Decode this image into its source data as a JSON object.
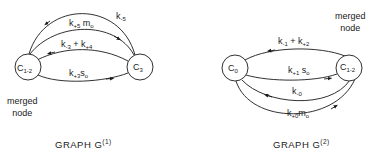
{
  "graphs": [
    {
      "id": "G1",
      "caption": {
        "prefix": "GRAPH G",
        "superscript": "(1)"
      },
      "merged_note": [
        "merged",
        "node"
      ],
      "nodes": [
        {
          "id": "C1-2",
          "base": "C",
          "sub": "1-2",
          "merged": true
        },
        {
          "id": "C3",
          "base": "C",
          "sub": "3"
        }
      ],
      "edges": [
        {
          "from": "C3",
          "to": "C1-2",
          "label": [
            {
              "t": "k"
            },
            {
              "s": "-5"
            }
          ]
        },
        {
          "from": "C1-2",
          "to": "C3",
          "label": [
            {
              "t": "k"
            },
            {
              "s": "+5"
            },
            {
              "t": " m"
            },
            {
              "s": "o"
            }
          ]
        },
        {
          "from": "C3",
          "to": "C1-2",
          "label": [
            {
              "t": "k"
            },
            {
              "s": "-3"
            },
            {
              "t": " + k"
            },
            {
              "s": "+4"
            }
          ]
        },
        {
          "from": "C1-2",
          "to": "C3",
          "label": [
            {
              "t": "k"
            },
            {
              "s": "+3"
            },
            {
              "t": "s"
            },
            {
              "s": "o"
            }
          ]
        }
      ]
    },
    {
      "id": "G2",
      "caption": {
        "prefix": "GRAPH G",
        "superscript": "(2)"
      },
      "merged_note": [
        "merged",
        "node"
      ],
      "nodes": [
        {
          "id": "C0",
          "base": "C",
          "sub": "0"
        },
        {
          "id": "C1-2",
          "base": "C",
          "sub": "1-2",
          "merged": true
        }
      ],
      "edges": [
        {
          "from": "C1-2",
          "to": "C0",
          "label": [
            {
              "t": "k"
            },
            {
              "s": "-1"
            },
            {
              "t": " + k"
            },
            {
              "s": "+2"
            }
          ]
        },
        {
          "from": "C0",
          "to": "C1-2",
          "label": [
            {
              "t": "k"
            },
            {
              "s": "+1"
            },
            {
              "t": " s"
            },
            {
              "s": "o"
            }
          ]
        },
        {
          "from": "C1-2",
          "to": "C0",
          "label": [
            {
              "t": "k"
            },
            {
              "s": "-0"
            }
          ]
        },
        {
          "from": "C0",
          "to": "C1-2",
          "label": [
            {
              "t": "k"
            },
            {
              "s": "+0"
            },
            {
              "t": "m"
            },
            {
              "s": "o"
            }
          ]
        }
      ]
    }
  ],
  "labels": {
    "g1_node_left": "C",
    "g1_node_left_sub": "1-2",
    "g1_node_right": "C",
    "g1_node_right_sub": "3",
    "g1_e1": "k",
    "g1_e1_sub": "-5",
    "g1_e2": "k",
    "g1_e2_sub1": "+5",
    "g1_e2_m": " m",
    "g1_e2_sub2": "o",
    "g1_e3": "k",
    "g1_e3_sub1": "-3",
    "g1_e3_mid": " + k",
    "g1_e3_sub2": "+4",
    "g1_e4": "k",
    "g1_e4_sub1": "+3",
    "g1_e4_s": "s",
    "g1_e4_sub2": "o",
    "g2_node_left": "C",
    "g2_node_left_sub": "0",
    "g2_node_right": "C",
    "g2_node_right_sub": "1-2",
    "g2_e1": "k",
    "g2_e1_sub1": "-1",
    "g2_e1_mid": " + k",
    "g2_e1_sub2": "+2",
    "g2_e2": "k",
    "g2_e2_sub1": "+1",
    "g2_e2_s": " s",
    "g2_e2_sub2": "o",
    "g2_e3": "k",
    "g2_e3_sub": "-0",
    "g2_e4": "k",
    "g2_e4_sub1": "+0",
    "g2_e4_m": "m",
    "g2_e4_sub2": "o",
    "merged1": "merged",
    "node1": "node",
    "merged2": "merged",
    "node2": "node",
    "cap1": "GRAPH G",
    "cap1_sup": "(1)",
    "cap2": "GRAPH G",
    "cap2_sup": "(2)"
  }
}
